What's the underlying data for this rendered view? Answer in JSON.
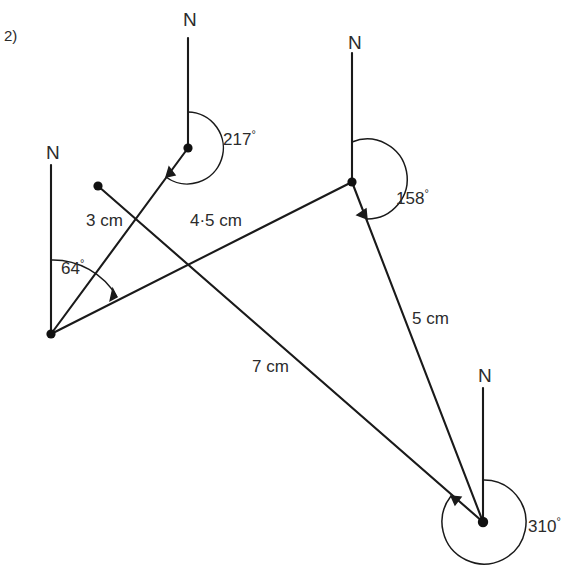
{
  "question": {
    "number": "2)"
  },
  "diagram": {
    "type": "bearings-diagram",
    "north_labels": [
      {
        "id": "north-label-a",
        "text": "N",
        "x": 46,
        "y": 143
      },
      {
        "id": "north-label-b",
        "text": "N",
        "x": 183,
        "y": 10
      },
      {
        "id": "north-label-c",
        "text": "N",
        "x": 348,
        "y": 33
      },
      {
        "id": "north-label-d",
        "text": "N",
        "x": 478,
        "y": 366
      }
    ],
    "vertices": [
      {
        "id": "vertex-a",
        "x": 51,
        "y": 334
      },
      {
        "id": "vertex-b",
        "x": 188,
        "y": 148
      },
      {
        "id": "vertex-c",
        "x": 352,
        "y": 182
      },
      {
        "id": "vertex-d",
        "x": 483,
        "y": 522
      },
      {
        "id": "vertex-e",
        "x": 98,
        "y": 186
      }
    ],
    "north_lines": [
      {
        "id": "north-line-a",
        "x1": 51,
        "y1": 165,
        "x2": 51,
        "y2": 334
      },
      {
        "id": "north-line-b",
        "x1": 188,
        "y1": 38,
        "x2": 188,
        "y2": 148
      },
      {
        "id": "north-line-c",
        "x1": 352,
        "y1": 53,
        "x2": 352,
        "y2": 182
      },
      {
        "id": "north-line-d",
        "x1": 483,
        "y1": 388,
        "x2": 483,
        "y2": 522
      }
    ],
    "segments": [
      {
        "id": "segment-3cm",
        "x1": 51,
        "y1": 334,
        "x2": 188,
        "y2": 148
      },
      {
        "id": "segment-4-5cm",
        "x1": 51,
        "y1": 334,
        "x2": 352,
        "y2": 182
      },
      {
        "id": "segment-7cm",
        "x1": 98,
        "y1": 186,
        "x2": 483,
        "y2": 522
      },
      {
        "id": "segment-5cm",
        "x1": 352,
        "y1": 182,
        "x2": 483,
        "y2": 522
      }
    ],
    "length_labels": [
      {
        "id": "length-3cm",
        "text": "3 cm",
        "x": 86,
        "y": 212
      },
      {
        "id": "length-4-5cm",
        "text": "4·5 cm",
        "x": 190,
        "y": 212
      },
      {
        "id": "length-5cm",
        "text": "5 cm",
        "x": 412,
        "y": 310
      },
      {
        "id": "length-7cm",
        "text": "7 cm",
        "x": 252,
        "y": 358
      }
    ],
    "angles": [
      {
        "id": "angle-64",
        "value": "64",
        "degree_symbol": "°",
        "label_x": 61,
        "label_y": 258,
        "vertex_x": 51,
        "vertex_y": 334,
        "radius": 74
      },
      {
        "id": "angle-217",
        "value": "217",
        "degree_symbol": "°",
        "label_x": 223,
        "label_y": 129,
        "vertex_x": 188,
        "vertex_y": 148,
        "radius": 36
      },
      {
        "id": "angle-158",
        "value": "158",
        "degree_symbol": "°",
        "label_x": 396,
        "label_y": 188,
        "vertex_x": 352,
        "vertex_y": 182,
        "radius": 40
      },
      {
        "id": "angle-310",
        "value": "310",
        "degree_symbol": "°",
        "label_x": 528,
        "label_y": 516,
        "vertex_x": 483,
        "vertex_y": 522,
        "radius": 42
      }
    ]
  }
}
